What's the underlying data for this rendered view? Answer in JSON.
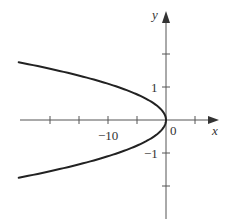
{
  "chart_data": {
    "type": "line",
    "title": "",
    "xlabel": "x",
    "ylabel": "y",
    "equation_approx": "x = -8.3 y^2",
    "xlim": [
      -25,
      9
    ],
    "ylim": [
      -3,
      3.3
    ],
    "grid": false,
    "legend": null,
    "x_ticks": [
      -20,
      -15,
      -10,
      -5,
      0,
      5
    ],
    "x_tick_labels": [
      {
        "value": -10,
        "label": "−10"
      },
      {
        "value": 0,
        "label": "0"
      }
    ],
    "y_ticks": [
      -2,
      -1,
      1,
      2
    ],
    "y_tick_labels": [
      {
        "value": 1,
        "label": "1"
      },
      {
        "value": -1,
        "label": "−1"
      }
    ],
    "series": [
      {
        "name": "parabola",
        "color": "#222222",
        "points": [
          [
            -25.4,
            -1.75
          ],
          [
            -21.2,
            -1.6
          ],
          [
            -17.6,
            -1.45
          ],
          [
            -14.2,
            -1.3
          ],
          [
            -11.2,
            -1.15
          ],
          [
            -8.3,
            -1.0
          ],
          [
            -6.0,
            -0.85
          ],
          [
            -4.1,
            -0.7
          ],
          [
            -2.5,
            -0.55
          ],
          [
            -1.3,
            -0.4
          ],
          [
            -0.5,
            -0.25
          ],
          [
            -0.1,
            -0.1
          ],
          [
            0.0,
            0.0
          ],
          [
            -0.1,
            0.1
          ],
          [
            -0.5,
            0.25
          ],
          [
            -1.3,
            0.4
          ],
          [
            -2.5,
            0.55
          ],
          [
            -4.1,
            0.7
          ],
          [
            -6.0,
            0.85
          ],
          [
            -8.3,
            1.0
          ],
          [
            -11.2,
            1.15
          ],
          [
            -14.2,
            1.3
          ],
          [
            -17.6,
            1.45
          ],
          [
            -21.2,
            1.6
          ],
          [
            -25.4,
            1.75
          ]
        ]
      }
    ]
  },
  "axis": {
    "x_label": "x",
    "y_label": "y",
    "origin_label": "0",
    "x_tick_label_neg10": "−10",
    "y_tick_label_1": "1",
    "y_tick_label_neg1": "−1"
  },
  "colors": {
    "background": "#ffffff",
    "curve": "#222222",
    "axis": "#555555",
    "text": "#333333"
  }
}
